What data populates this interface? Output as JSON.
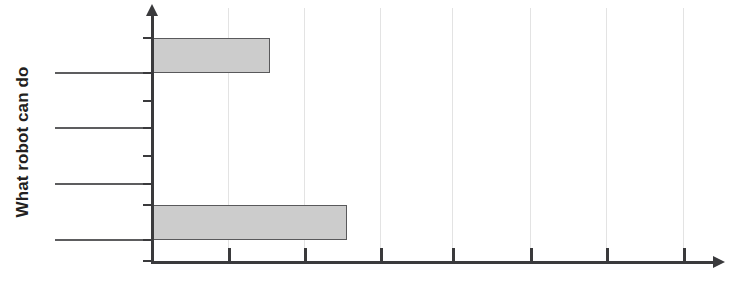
{
  "chart": {
    "y_axis_title": "What robot can do",
    "title_clipped": "",
    "bar_fill_color": "#cccccc",
    "bar_border_color": "#59595b",
    "axis_color": "#3a3a3c",
    "gridline_color": "#e3e3e3"
  },
  "chart_data": {
    "type": "bar",
    "orientation": "horizontal",
    "title": "",
    "xlabel": "",
    "ylabel": "What robot can do",
    "categories": [
      "category-1",
      "category-2",
      "category-3",
      "category-4"
    ],
    "values": [
      1.55,
      0,
      0,
      2.57
    ],
    "xlim": [
      0,
      7.6
    ],
    "ylim": [
      0,
      4
    ],
    "grid": true,
    "gridlines_x": [
      1,
      2,
      3,
      4,
      5,
      6,
      7
    ],
    "x_tick_positions": [
      0,
      1,
      2,
      3,
      4,
      5,
      6,
      7
    ],
    "x_tick_labels": [],
    "y_tick_labels": [],
    "legend": null,
    "legend_position": "none",
    "annotations": []
  },
  "bars": [
    {
      "name": "bar-top",
      "left_px": 0,
      "top_px": 30,
      "width_px": 118,
      "height_px": 35
    },
    {
      "name": "bar-bottom",
      "left_px": 0,
      "top_px": 197,
      "width_px": 195,
      "height_px": 35
    }
  ],
  "gridlines": [
    {
      "x_px": 76
    },
    {
      "x_px": 152
    },
    {
      "x_px": 228
    },
    {
      "x_px": 300
    },
    {
      "x_px": 378
    },
    {
      "x_px": 454
    },
    {
      "x_px": 531
    }
  ],
  "x_ticks": [
    {
      "x_px": 151
    },
    {
      "x_px": 228
    },
    {
      "x_px": 304
    },
    {
      "x_px": 380
    },
    {
      "x_px": 452
    },
    {
      "x_px": 530
    },
    {
      "x_px": 606
    },
    {
      "x_px": 683
    }
  ],
  "y_ticks": [
    {
      "y_px": 37
    },
    {
      "y_px": 72
    },
    {
      "y_px": 100
    },
    {
      "y_px": 127
    },
    {
      "y_px": 155
    },
    {
      "y_px": 183
    },
    {
      "y_px": 204
    },
    {
      "y_px": 239
    },
    {
      "y_px": 260
    }
  ],
  "y_category_lines": [
    {
      "y_px": 72
    },
    {
      "y_px": 127
    },
    {
      "y_px": 183
    },
    {
      "y_px": 239
    }
  ]
}
